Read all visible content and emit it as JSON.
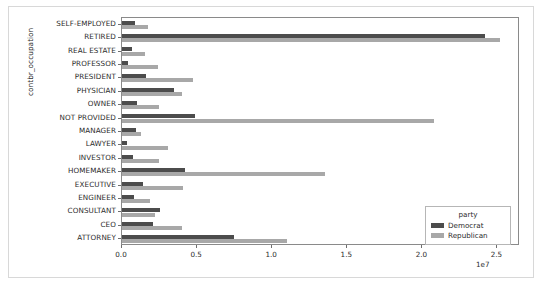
{
  "chart_data": {
    "type": "bar",
    "orientation": "horizontal",
    "title": "",
    "xlabel": "",
    "ylabel": "contbr_occupation",
    "x_exponent": "1e7",
    "xlim": [
      0,
      26500000
    ],
    "xticks": [
      0,
      5000000,
      10000000,
      15000000,
      20000000,
      25000000
    ],
    "xtick_labels": [
      "0.0",
      "0.5",
      "1.0",
      "1.5",
      "2.0",
      "2.5"
    ],
    "grid": false,
    "legend": {
      "title": "party",
      "position": "lower right",
      "entries": [
        {
          "name": "Democrat",
          "color": "#4c4c4c"
        },
        {
          "name": "Republican",
          "color": "#a8a8a8"
        }
      ]
    },
    "categories": [
      "SELF-EMPLOYED",
      "RETIRED",
      "REAL ESTATE",
      "PROFESSOR",
      "PRESIDENT",
      "PHYSICIAN",
      "OWNER",
      "NOT PROVIDED",
      "MANAGER",
      "LAWYER",
      "INVESTOR",
      "HOMEMAKER",
      "EXECUTIVE",
      "ENGINEER",
      "CONSULTANT",
      "CEO",
      "ATTORNEY"
    ],
    "series": [
      {
        "name": "Democrat",
        "color": "#4c4c4c",
        "values": [
          880000,
          24200000,
          640000,
          420000,
          1600000,
          3450000,
          1020000,
          4850000,
          920000,
          320000,
          760000,
          4200000,
          1420000,
          810000,
          2540000,
          2050000,
          7450000
        ]
      },
      {
        "name": "Republican",
        "color": "#a8a8a8",
        "values": [
          1700000,
          25150000,
          1500000,
          2420000,
          4750000,
          4000000,
          2440000,
          20800000,
          1260000,
          3040000,
          2450000,
          13500000,
          4060000,
          1860000,
          2190000,
          4000000,
          11000000
        ]
      }
    ]
  }
}
